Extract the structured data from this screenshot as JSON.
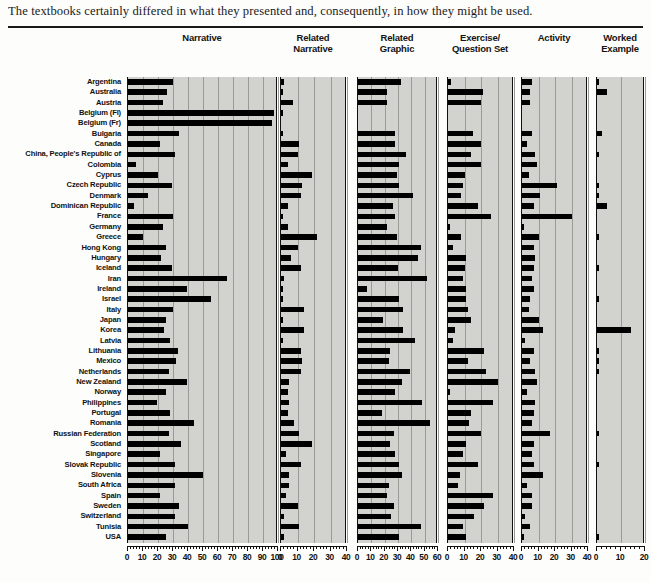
{
  "caption": "The textbooks certainly differed in what they presented and, consequently, in how they might be used.",
  "chart_data": {
    "type": "bar",
    "title": "",
    "orientation": "horizontal",
    "grid": true,
    "legend": false,
    "xlabel": "",
    "ylabel": "",
    "categories": [
      "Argentina",
      "Australia",
      "Austria",
      "Belgium (Fl)",
      "Belgium (Fr)",
      "Bulgaria",
      "Canada",
      "China, People's Republic of",
      "Colombia",
      "Cyprus",
      "Czech Republic",
      "Denmark",
      "Dominican Republic",
      "France",
      "Germany",
      "Greece",
      "Hong Kong",
      "Hungary",
      "Iceland",
      "Iran",
      "Ireland",
      "Israel",
      "Italy",
      "Japan",
      "Korea",
      "Latvia",
      "Lithuania",
      "Mexico",
      "Netherlands",
      "New Zealand",
      "Norway",
      "Philippines",
      "Portugal",
      "Romania",
      "Russian Federation",
      "Scotland",
      "Singapore",
      "Slovak Republic",
      "Slovenia",
      "South Africa",
      "Spain",
      "Sweden",
      "Switzerland",
      "Tunisia",
      "USA"
    ],
    "panels": [
      {
        "key": "narrative",
        "title_lines": [
          "Narrative"
        ],
        "xlim": [
          0,
          100
        ],
        "ticks": [
          0,
          10,
          20,
          30,
          40,
          50,
          60,
          70,
          80,
          90,
          100
        ],
        "tick_labels": [
          "0",
          "10",
          "20",
          "30",
          "40",
          "50",
          "60",
          "70",
          "80",
          "90",
          "100"
        ],
        "minor_step": 2,
        "values": [
          30,
          26,
          23,
          97,
          96,
          34,
          21,
          31,
          5,
          20,
          29,
          13,
          4,
          30,
          23,
          10,
          25,
          22,
          29,
          66,
          39,
          55,
          30,
          25,
          24,
          28,
          33,
          32,
          27,
          39,
          25,
          19,
          28,
          44,
          27,
          35,
          21,
          31,
          50,
          31,
          21,
          34,
          31,
          40,
          25
        ]
      },
      {
        "key": "related_narrative",
        "title_lines": [
          "Related",
          "Narrative"
        ],
        "xlim": [
          0,
          40
        ],
        "ticks": [
          0,
          10,
          20,
          30,
          40
        ],
        "tick_labels": [
          "0",
          "10",
          "20",
          "30",
          "40"
        ],
        "minor_step": 2,
        "values": [
          2,
          1,
          7,
          1,
          0,
          1,
          11,
          10,
          4,
          19,
          13,
          12,
          4,
          1,
          4,
          22,
          10,
          6,
          12,
          2,
          1,
          1,
          14,
          1,
          14,
          1,
          12,
          13,
          12,
          5,
          4,
          5,
          4,
          8,
          11,
          19,
          3,
          12,
          5,
          5,
          3,
          10,
          2,
          11,
          2
        ]
      },
      {
        "key": "related_graphic",
        "title_lines": [
          "Related",
          "Graphic"
        ],
        "xlim": [
          0,
          60
        ],
        "ticks": [
          0,
          10,
          20,
          30,
          40,
          50,
          60
        ],
        "tick_labels": [
          "0",
          "10",
          "20",
          "30",
          "40",
          "50",
          "60"
        ],
        "minor_step": 2,
        "values": [
          32,
          22,
          22,
          0,
          0,
          28,
          28,
          36,
          31,
          29,
          31,
          41,
          26,
          28,
          22,
          29,
          47,
          45,
          30,
          52,
          7,
          31,
          34,
          19,
          34,
          43,
          24,
          23,
          39,
          33,
          28,
          48,
          18,
          54,
          27,
          24,
          28,
          31,
          33,
          23,
          22,
          27,
          25,
          47,
          31
        ]
      },
      {
        "key": "exercise_question_set",
        "title_lines": [
          "Exercise/",
          "Question Set"
        ],
        "xlim": [
          0,
          40
        ],
        "ticks": [
          0,
          10,
          20,
          30,
          40
        ],
        "tick_labels": [
          "0",
          "10",
          "20",
          "30",
          "40"
        ],
        "minor_step": 2,
        "values": [
          2,
          21,
          20,
          0,
          0,
          15,
          20,
          14,
          20,
          10,
          9,
          8,
          18,
          26,
          1,
          8,
          3,
          11,
          10,
          9,
          11,
          11,
          12,
          14,
          4,
          3,
          22,
          12,
          23,
          30,
          1,
          27,
          14,
          13,
          20,
          11,
          9,
          18,
          7,
          6,
          27,
          22,
          16,
          9,
          11
        ]
      },
      {
        "key": "activity",
        "title_lines": [
          "Activity"
        ],
        "xlim": [
          0,
          40
        ],
        "ticks": [
          0,
          10,
          20,
          30,
          40
        ],
        "tick_labels": [
          "0",
          "10",
          "20",
          "30",
          "40"
        ],
        "minor_step": 2,
        "values": [
          6,
          5,
          5,
          0,
          0,
          6,
          3,
          8,
          9,
          4,
          21,
          11,
          7,
          30,
          1,
          10,
          7,
          8,
          7,
          6,
          7,
          5,
          4,
          10,
          13,
          2,
          7,
          5,
          8,
          9,
          3,
          8,
          7,
          6,
          17,
          7,
          6,
          7,
          13,
          3,
          6,
          6,
          2,
          5,
          1
        ]
      },
      {
        "key": "worked_example",
        "title_lines": [
          "Worked",
          "Example"
        ],
        "xlim": [
          0,
          20
        ],
        "ticks": [
          0,
          10,
          20
        ],
        "tick_labels": [
          "0",
          "10",
          "20"
        ],
        "minor_step": 2,
        "values": [
          1,
          4,
          0,
          0,
          0,
          2,
          0,
          1,
          0,
          0,
          1,
          1,
          4,
          0,
          0,
          1,
          0,
          0,
          1,
          0,
          0,
          1,
          0,
          0,
          14,
          0,
          1,
          1,
          1,
          0,
          0,
          0,
          0,
          0,
          1,
          0,
          0,
          1,
          0,
          0,
          0,
          0,
          0,
          0,
          1
        ]
      }
    ]
  }
}
